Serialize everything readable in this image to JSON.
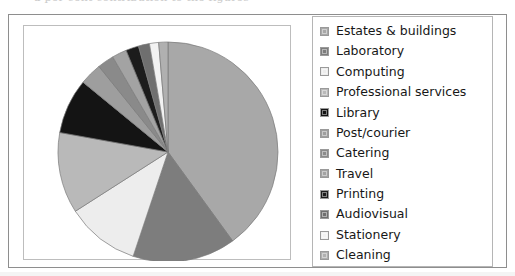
{
  "scan": {
    "header_fragment": "a per cent contribution to the figures"
  },
  "legend": {
    "items": [
      {
        "label": "Estates & buildings",
        "color": "#a8a8a8"
      },
      {
        "label": "Laboratory",
        "color": "#7d7d7d"
      },
      {
        "label": "Computing",
        "color": "#ededed"
      },
      {
        "label": "Professional services",
        "color": "#b9b9b9"
      },
      {
        "label": "Library",
        "color": "#141414"
      },
      {
        "label": "Post/courier",
        "color": "#9e9e9e"
      },
      {
        "label": "Catering",
        "color": "#8a8a8a"
      },
      {
        "label": "Travel",
        "color": "#a3a3a3"
      },
      {
        "label": "Printing",
        "color": "#1c1c1c"
      },
      {
        "label": "Audiovisual",
        "color": "#6f6f6f"
      },
      {
        "label": "Stationery",
        "color": "#f2f2f2"
      },
      {
        "label": "Cleaning",
        "color": "#b0b0b0"
      }
    ]
  },
  "chart_data": {
    "type": "pie",
    "title": "",
    "legend_position": "right",
    "start_angle_deg": 0,
    "direction": "clockwise",
    "categories": [
      "Estates & buildings",
      "Laboratory",
      "Computing",
      "Professional services",
      "Library",
      "Post/courier",
      "Catering",
      "Travel",
      "Printing",
      "Audiovisual",
      "Stationery",
      "Cleaning"
    ],
    "values": [
      41.1,
      15.6,
      11.1,
      12.2,
      8.3,
      3.3,
      2.5,
      2.2,
      1.9,
      1.7,
      1.4,
      1.4
    ],
    "value_unit": "percent",
    "angles_deg": [
      148,
      56,
      40,
      44,
      30,
      12,
      9,
      8,
      7,
      6,
      5,
      5
    ],
    "colors": [
      "#a8a8a8",
      "#7d7d7d",
      "#ededed",
      "#b9b9b9",
      "#141414",
      "#9e9e9e",
      "#8a8a8a",
      "#a3a3a3",
      "#1c1c1c",
      "#6f6f6f",
      "#f2f2f2",
      "#b0b0b0"
    ],
    "data_labels_shown": false,
    "grid": false
  },
  "geometry": {
    "center_x": 144,
    "center_y": 126,
    "radius": 110
  }
}
